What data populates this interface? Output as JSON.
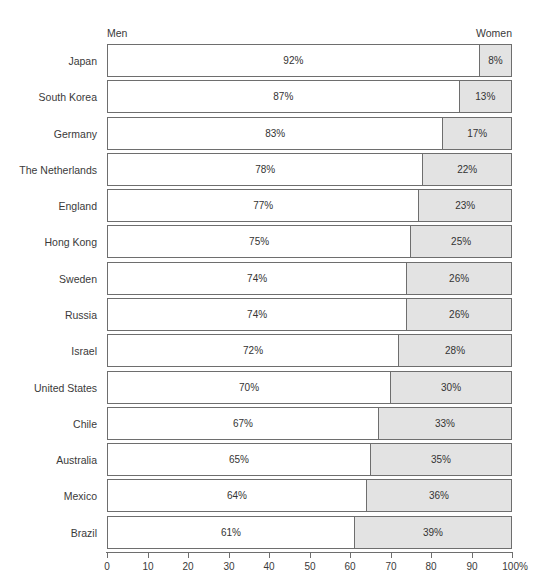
{
  "header": {
    "left_series_label": "Men",
    "right_series_label": "Women"
  },
  "axis": {
    "tick_labels": [
      "0",
      "10",
      "20",
      "30",
      "40",
      "50",
      "60",
      "70",
      "80",
      "90",
      "100%"
    ],
    "tick_values": [
      0,
      10,
      20,
      30,
      40,
      50,
      60,
      70,
      80,
      90,
      100
    ],
    "min": 0,
    "max": 100
  },
  "colors": {
    "men_fill": "#ffffff",
    "women_fill": "#e3e3e3",
    "bar_border": "#6e6e6e",
    "text": "#3a3a3a",
    "background": "#ffffff"
  },
  "chart_data": {
    "type": "bar",
    "title": "",
    "subtitle": "",
    "xlabel": "",
    "ylabel": "",
    "orientation": "horizontal",
    "stacked": true,
    "stacked_percent": true,
    "grid": false,
    "legend_position": "top",
    "xlim": [
      0,
      100
    ],
    "xticks": [
      0,
      10,
      20,
      30,
      40,
      50,
      60,
      70,
      80,
      90,
      100
    ],
    "xtick_labels": [
      "0",
      "10",
      "20",
      "30",
      "40",
      "50",
      "60",
      "70",
      "80",
      "90",
      "100%"
    ],
    "categories": [
      "Japan",
      "South Korea",
      "Germany",
      "The Netherlands",
      "England",
      "Hong Kong",
      "Sweden",
      "Russia",
      "Israel",
      "United States",
      "Chile",
      "Australia",
      "Mexico",
      "Brazil"
    ],
    "series": [
      {
        "name": "Men",
        "values": [
          92,
          87,
          83,
          78,
          77,
          75,
          74,
          74,
          72,
          70,
          67,
          65,
          64,
          61
        ],
        "labels": [
          "92%",
          "87%",
          "83%",
          "78%",
          "77%",
          "75%",
          "74%",
          "74%",
          "72%",
          "70%",
          "67%",
          "65%",
          "64%",
          "61%"
        ]
      },
      {
        "name": "Women",
        "values": [
          8,
          13,
          17,
          22,
          23,
          25,
          26,
          26,
          28,
          30,
          33,
          35,
          36,
          39
        ],
        "labels": [
          "8%",
          "13%",
          "17%",
          "22%",
          "23%",
          "25%",
          "26%",
          "26%",
          "28%",
          "30%",
          "33%",
          "35%",
          "36%",
          "39%"
        ]
      }
    ],
    "rows": [
      {
        "category": "Japan",
        "men": 92,
        "women": 8,
        "men_label": "92%",
        "women_label": "8%"
      },
      {
        "category": "South Korea",
        "men": 87,
        "women": 13,
        "men_label": "87%",
        "women_label": "13%"
      },
      {
        "category": "Germany",
        "men": 83,
        "women": 17,
        "men_label": "83%",
        "women_label": "17%"
      },
      {
        "category": "The Netherlands",
        "men": 78,
        "women": 22,
        "men_label": "78%",
        "women_label": "22%"
      },
      {
        "category": "England",
        "men": 77,
        "women": 23,
        "men_label": "77%",
        "women_label": "23%"
      },
      {
        "category": "Hong Kong",
        "men": 75,
        "women": 25,
        "men_label": "75%",
        "women_label": "25%"
      },
      {
        "category": "Sweden",
        "men": 74,
        "women": 26,
        "men_label": "74%",
        "women_label": "26%"
      },
      {
        "category": "Russia",
        "men": 74,
        "women": 26,
        "men_label": "74%",
        "women_label": "26%"
      },
      {
        "category": "Israel",
        "men": 72,
        "women": 28,
        "men_label": "72%",
        "women_label": "28%"
      },
      {
        "category": "United States",
        "men": 70,
        "women": 30,
        "men_label": "70%",
        "women_label": "30%"
      },
      {
        "category": "Chile",
        "men": 67,
        "women": 33,
        "men_label": "67%",
        "women_label": "33%"
      },
      {
        "category": "Australia",
        "men": 65,
        "women": 35,
        "men_label": "65%",
        "women_label": "35%"
      },
      {
        "category": "Mexico",
        "men": 64,
        "women": 36,
        "men_label": "64%",
        "women_label": "36%"
      },
      {
        "category": "Brazil",
        "men": 61,
        "women": 39,
        "men_label": "61%",
        "women_label": "39%"
      }
    ]
  }
}
